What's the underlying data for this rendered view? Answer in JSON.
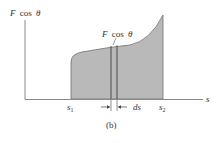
{
  "figure": {
    "caption": "(b)",
    "y_axis_label": "F cos θ",
    "y_axis_label_parts": {
      "var": "F",
      "func": "cos",
      "angle": "θ"
    },
    "x_axis_label": "s",
    "curve_label": "F cos θ",
    "curve_label_parts": {
      "var": "F",
      "func": "cos",
      "angle": "θ"
    },
    "tick_labels": {
      "s1": {
        "base": "s",
        "sub": "1"
      },
      "s2": {
        "base": "s",
        "sub": "2"
      }
    },
    "strip_width_label": "ds",
    "colors": {
      "fill": "#b9b9b9",
      "axis": "#8a8a8a",
      "outline": "#6f6f6f",
      "strip_line": "#4a4a4a",
      "text": "#333333"
    }
  }
}
